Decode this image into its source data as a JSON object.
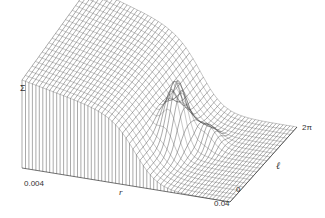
{
  "chart_data": {
    "type": "surface3d",
    "title": "",
    "zlabel": "Σ",
    "xlabel": "r",
    "ylabel": "ℓ",
    "x_ticks": [
      "0.004",
      "0.04"
    ],
    "y_ticks": [
      "0",
      "2π"
    ],
    "x_range": [
      0.004,
      0.04
    ],
    "y_range": [
      "0",
      "2π"
    ],
    "style": "wireframe, grayscale, no grid, no legend",
    "features": [
      {
        "name": "high plateau",
        "r_region": "0.004-0.015",
        "height": "high, decreasing with r"
      },
      {
        "name": "sharp peak",
        "r_approx": 0.025,
        "l_approx": "mid (~π)",
        "height": "medium-high"
      },
      {
        "name": "floor",
        "r_region": "0.03-0.04",
        "height": "near zero"
      }
    ]
  },
  "labels": {
    "z_axis": "Σ",
    "x_axis": "r",
    "y_axis": "ℓ",
    "x_tick_min": "0.004",
    "x_tick_max": "0.04",
    "y_tick_min": "0",
    "y_tick_max": "2π"
  }
}
